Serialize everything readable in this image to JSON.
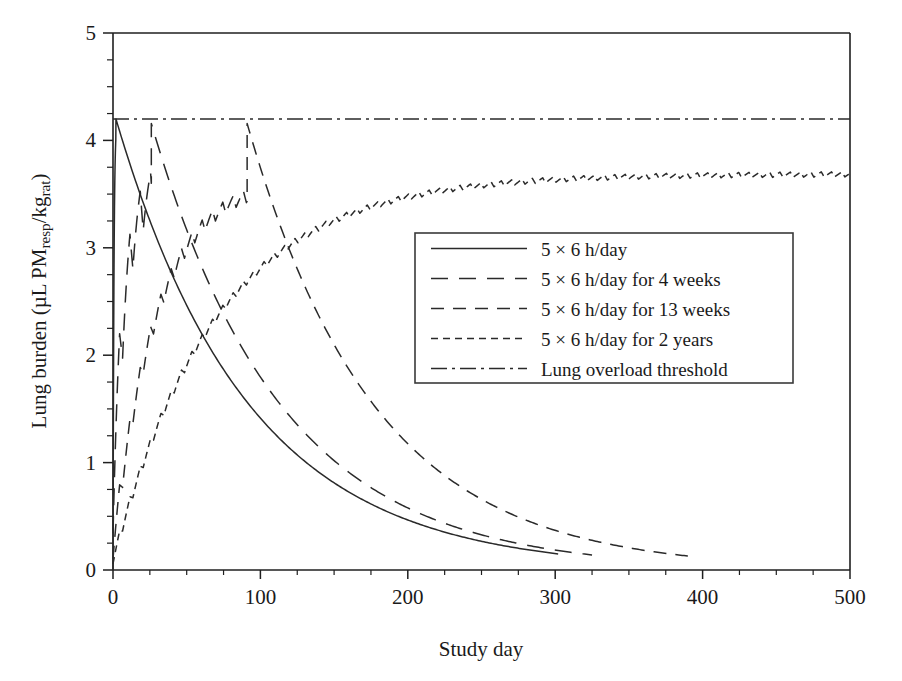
{
  "figure": {
    "width": 902,
    "height": 681,
    "background": "#ffffff",
    "ink_color": "#2a2a2a"
  },
  "chart_data": {
    "type": "line",
    "title": "",
    "xlabel": "Study day",
    "ylabel_parts": {
      "prefix": "Lung burden (µL PM",
      "sub1": "resp",
      "mid": "/kg",
      "sub2": "rat",
      "suffix": ")"
    },
    "ylabel": "Lung burden (µL PMresp/kgrat)",
    "xlim": [
      0,
      500
    ],
    "ylim": [
      0,
      5
    ],
    "xticks": [
      0,
      100,
      200,
      300,
      400,
      500
    ],
    "xtick_labels": [
      "0",
      "100",
      "200",
      "300",
      "400",
      "500"
    ],
    "xminor_step": 25,
    "yticks": [
      0,
      1,
      2,
      3,
      4,
      5
    ],
    "ytick_labels": [
      "0",
      "1",
      "2",
      "3",
      "4",
      "5"
    ],
    "yminor_step": 0.25,
    "grid": false,
    "legend_position": "center-right",
    "overload_threshold": 4.2,
    "exposure_pattern": {
      "days_on_per_week": 5,
      "days_off_per_week": 2,
      "hours_per_day": 6
    },
    "series": [
      {
        "name": "5 × 6 h/day",
        "key": "five_day",
        "dash": "solid",
        "dasharray": "",
        "exposure_days": 5,
        "peak_value": 4.2,
        "peak_day": 2,
        "end_day": 302,
        "end_value": 0.15,
        "clearance_half_life_days": 62,
        "description": "Single 5-day exposure week; burden reaches the overload threshold then clears monoexponentially."
      },
      {
        "name": "5 × 6 h/day for 4 weeks",
        "key": "four_weeks",
        "dash": "long-dash",
        "dasharray": "17 11",
        "exposure_days": 28,
        "peak_value": 4.2,
        "peak_day": 26,
        "end_day": 325,
        "end_value": 0.14,
        "clearance_half_life_days": 62,
        "description": "Four weeks of 5 x 6 h/day exposure reaching the threshold near day 26, then clearing."
      },
      {
        "name": "5 × 6 h/day for 13 weeks",
        "key": "thirteen_weeks",
        "dash": "medium-dash",
        "dasharray": "13 9",
        "exposure_days": 91,
        "peak_value": 4.2,
        "peak_day": 91,
        "end_day": 390,
        "end_value": 0.13,
        "clearance_half_life_days": 72,
        "description": "Thirteen weeks of exposure reaching the threshold near day 91, then clearing."
      },
      {
        "name": "5 × 6 h/day for 2 years",
        "key": "two_years",
        "dash": "short-dash",
        "dasharray": "7 5",
        "exposure_days": 500,
        "peak_value": 4.25,
        "peak_day": 500,
        "end_day": 500,
        "end_value": 4.25,
        "approach_time_constant_days": 95,
        "description": "Continuous 5 x 6 h/day exposure; saw-tooth weekly cycles asymptote to the overload threshold."
      },
      {
        "name": "Lung overload threshold",
        "key": "threshold",
        "dash": "dash-dot",
        "dasharray": "16 5 3 5",
        "constant_value": 4.2,
        "description": "Horizontal reference line at 4.2 µL PMresp/kgrat."
      }
    ],
    "annotations": []
  },
  "axes": {
    "left_px": 113,
    "right_px": 850,
    "top_px": 33,
    "bottom_px": 570
  },
  "legend": {
    "box": {
      "x": 415,
      "y": 233,
      "width": 378,
      "height": 150
    },
    "items": [
      {
        "label": "5 × 6 h/day",
        "dasharray": ""
      },
      {
        "label": "5 × 6 h/day for 4 weeks",
        "dasharray": "17 11"
      },
      {
        "label": "5 × 6 h/day for 13 weeks",
        "dasharray": "13 9"
      },
      {
        "label": "5 × 6 h/day for 2 years",
        "dasharray": "7 5"
      },
      {
        "label": "Lung overload threshold",
        "dasharray": "16 5 3 5"
      }
    ]
  }
}
